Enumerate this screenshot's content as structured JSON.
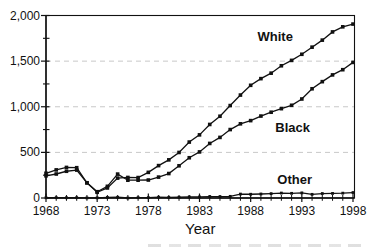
{
  "figure": {
    "background_color": "#ffffff",
    "line_color": "#111111",
    "grid_color": "#c8c8c8"
  },
  "chart_data": {
    "type": "line",
    "title": "",
    "xlabel": "Year",
    "ylabel": "",
    "xlim": [
      1968,
      1998
    ],
    "ylim": [
      0,
      2000
    ],
    "x_ticks": [
      1968,
      1973,
      1978,
      1983,
      1988,
      1993,
      1998
    ],
    "x_minor_step": 1,
    "y_ticks": [
      0,
      500,
      1000,
      1500,
      2000
    ],
    "y_tick_labels": [
      "0",
      "500",
      "1,000",
      "1,500",
      "2,000"
    ],
    "y_minor_step": 250,
    "grid": "horizontal dashed at 500, 1000, 1500",
    "legend_position": "inline-labels",
    "x": [
      1968,
      1969,
      1970,
      1971,
      1972,
      1973,
      1974,
      1975,
      1976,
      1977,
      1978,
      1979,
      1980,
      1981,
      1982,
      1983,
      1984,
      1985,
      1986,
      1987,
      1988,
      1989,
      1990,
      1991,
      1992,
      1993,
      1994,
      1995,
      1996,
      1997,
      1998
    ],
    "series": [
      {
        "name": "White",
        "marker": "square",
        "marker_size": 3.6,
        "label_at": {
          "x": 1990.4,
          "y": 1775
        },
        "values": [
          243,
          263,
          293,
          306,
          167,
          63,
          110,
          218,
          225,
          224,
          281,
          355,
          418,
          499,
          613,
          692,
          806,
          896,
          1013,
          1128,
          1235,
          1308,
          1368,
          1449,
          1508,
          1575,
          1653,
          1730,
          1820,
          1876,
          1906
        ]
      },
      {
        "name": "Black",
        "marker": "square",
        "marker_size": 3.6,
        "label_at": {
          "x": 1992.1,
          "y": 768
        },
        "values": [
          271,
          308,
          335,
          332,
          166,
          69,
          128,
          262,
          195,
          195,
          197,
          229,
          268,
          353,
          441,
          505,
          598,
          664,
          750,
          813,
          848,
          898,
          940,
          979,
          1016,
          1085,
          1197,
          1275,
          1349,
          1406,
          1486
        ]
      },
      {
        "name": "Other",
        "marker": "square",
        "marker_size": 2.8,
        "label_at": {
          "x": 1992.3,
          "y": 208
        },
        "values": [
          3,
          4,
          3,
          4,
          1,
          2,
          6,
          8,
          0,
          4,
          4,
          9,
          6,
          8,
          12,
          12,
          16,
          15,
          18,
          43,
          41,
          44,
          48,
          54,
          51,
          56,
          40,
          49,
          50,
          53,
          60
        ]
      }
    ]
  }
}
